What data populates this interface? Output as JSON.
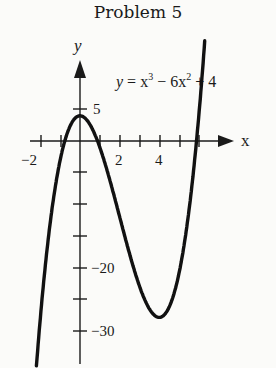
{
  "title": "Problem 5",
  "equation": {
    "lhs": "y = x",
    "exp1": "3",
    "mid": " − 6x",
    "exp2": "2",
    "rhs": " + 4"
  },
  "chart_data": {
    "type": "line",
    "title": "Problem 5",
    "function": "y = x^3 - 6x^2 + 4",
    "xlabel": "x",
    "ylabel": "y",
    "xlim": [
      -2.2,
      6.3
    ],
    "ylim": [
      -35,
      10
    ],
    "x_tick_values": [
      -2,
      -1,
      0,
      1,
      2,
      3,
      4,
      5,
      6
    ],
    "x_tick_labels": [
      "-2",
      "",
      "",
      "",
      "2",
      "",
      "4",
      "",
      ""
    ],
    "y_tick_values": [
      5,
      0,
      -5,
      -10,
      -15,
      -20,
      -25,
      -30
    ],
    "y_tick_labels": [
      "5",
      "",
      "",
      "",
      "",
      "−20",
      "",
      "−30"
    ],
    "key_points": [
      {
        "x": 0,
        "y": 4,
        "label": "local max"
      },
      {
        "x": 4,
        "y": -28,
        "label": "local min"
      }
    ],
    "grid": false,
    "legend": "none"
  },
  "axis_labels": {
    "x": "x",
    "y": "y"
  },
  "tick_labels": {
    "x_neg2": "−2",
    "x_2": "2",
    "x_4": "4",
    "y_5": "5",
    "y_neg20": "−20",
    "y_neg30": "−30"
  }
}
